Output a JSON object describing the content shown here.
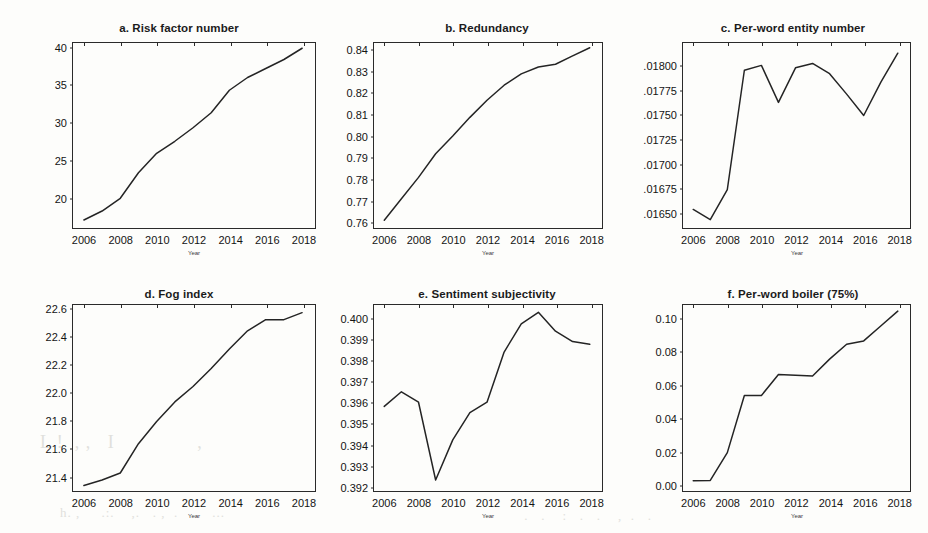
{
  "figure": {
    "background_color": "#fdfdfb",
    "line_color": "#242424",
    "axis_color": "#2a2a2a",
    "xaxis_title": "Year",
    "xtick_labels": [
      "2006",
      "2008",
      "2010",
      "2012",
      "2014",
      "2016",
      "2018"
    ],
    "xtick_values": [
      2006,
      2008,
      2010,
      2012,
      2014,
      2016,
      2018
    ],
    "xlim": [
      2005.4,
      2018.6
    ]
  },
  "chart_data": [
    {
      "type": "line",
      "panel": "a",
      "title": "a. Risk factor number",
      "xlabel": "Year",
      "ylabel": "",
      "x": [
        2006,
        2007,
        2008,
        2009,
        2010,
        2011,
        2012,
        2013,
        2014,
        2015,
        2016,
        2017,
        2018
      ],
      "values": [
        17.0,
        18.2,
        19.9,
        23.3,
        25.9,
        27.5,
        29.3,
        31.3,
        34.3,
        36.0,
        37.2,
        38.4,
        39.9
      ],
      "ytick_labels": [
        "20",
        "25",
        "30",
        "35",
        "40"
      ],
      "ytick_values": [
        20,
        25,
        30,
        35,
        40
      ],
      "ylim": [
        16.2,
        40.6
      ],
      "grid": false,
      "legend": "none"
    },
    {
      "type": "line",
      "panel": "b",
      "title": "b. Redundancy",
      "xlabel": "Year",
      "ylabel": "",
      "x": [
        2006,
        2007,
        2008,
        2009,
        2010,
        2011,
        2012,
        2013,
        2014,
        2015,
        2016,
        2017,
        2018
      ],
      "values": [
        0.7605,
        0.7705,
        0.7805,
        0.7915,
        0.7998,
        0.8085,
        0.8165,
        0.8235,
        0.8288,
        0.832,
        0.8333,
        0.8372,
        0.841
      ],
      "ytick_labels": [
        "0.76",
        "0.77",
        "0.78",
        "0.79",
        "0.80",
        "0.81",
        "0.82",
        "0.83",
        "0.84"
      ],
      "ytick_values": [
        0.76,
        0.77,
        0.78,
        0.79,
        0.8,
        0.81,
        0.82,
        0.83,
        0.84
      ],
      "ylim": [
        0.7578,
        0.8432
      ],
      "grid": false,
      "legend": "none"
    },
    {
      "type": "line",
      "panel": "c",
      "title": "c. Per-word entity number",
      "xlabel": "Year",
      "ylabel": "",
      "x": [
        2006,
        2007,
        2008,
        2009,
        2010,
        2011,
        2012,
        2013,
        2014,
        2015,
        2016,
        2017,
        2018
      ],
      "values": [
        0.016525,
        0.01642,
        0.01673,
        0.017955,
        0.018005,
        0.017625,
        0.01798,
        0.018025,
        0.01792,
        0.01771,
        0.01749,
        0.01783,
        0.01813
      ],
      "ytick_labels": [
        ".01650",
        ".01675",
        ".01700",
        ".01725",
        ".01750",
        ".01775",
        ".01800"
      ],
      "ytick_values": [
        0.0165,
        0.01675,
        0.017,
        0.01725,
        0.0175,
        0.01775,
        0.018
      ],
      "ylim": [
        0.016355,
        0.018235
      ],
      "grid": false,
      "legend": "none"
    },
    {
      "type": "line",
      "panel": "d",
      "title": "d. Fog index",
      "xlabel": "Year",
      "ylabel": "",
      "x": [
        2006,
        2007,
        2008,
        2009,
        2010,
        2011,
        2012,
        2013,
        2014,
        2015,
        2016,
        2017,
        2018
      ],
      "values": [
        21.33,
        21.37,
        21.42,
        21.63,
        21.79,
        21.93,
        22.04,
        22.17,
        22.31,
        22.44,
        22.52,
        22.52,
        22.57
      ],
      "ytick_labels": [
        "21.4",
        "21.6",
        "21.8",
        "22.0",
        "22.2",
        "22.4",
        "22.6"
      ],
      "ytick_values": [
        21.4,
        21.6,
        21.8,
        22.0,
        22.2,
        22.4,
        22.6
      ],
      "ylim": [
        21.305,
        22.625
      ],
      "grid": false,
      "legend": "none"
    },
    {
      "type": "line",
      "panel": "e",
      "title": "e. Sentiment subjectivity",
      "xlabel": "Year",
      "ylabel": "",
      "x": [
        2006,
        2007,
        2008,
        2009,
        2010,
        2011,
        2012,
        2013,
        2014,
        2015,
        2016,
        2017,
        2018
      ],
      "values": [
        0.3958,
        0.3965,
        0.396,
        0.39228,
        0.3942,
        0.3955,
        0.396,
        0.3984,
        0.39975,
        0.4003,
        0.3994,
        0.3989,
        0.39877
      ],
      "ytick_labels": [
        "0.392",
        "0.393",
        "0.394",
        "0.395",
        "0.396",
        "0.397",
        "0.398",
        "0.399",
        "0.400"
      ],
      "ytick_values": [
        0.392,
        0.393,
        0.394,
        0.395,
        0.396,
        0.397,
        0.398,
        0.399,
        0.4
      ],
      "ylim": [
        0.39185,
        0.40065
      ],
      "grid": false,
      "legend": "none"
    },
    {
      "type": "line",
      "panel": "f",
      "title": "f. Per-word boiler (75%)",
      "xlabel": "Year",
      "ylabel": "",
      "x": [
        2006,
        2007,
        2008,
        2009,
        2010,
        2011,
        2012,
        2013,
        2014,
        2015,
        2016,
        2017,
        2018
      ],
      "values": [
        0.002,
        0.0022,
        0.019,
        0.0535,
        0.0535,
        0.0662,
        0.0658,
        0.0653,
        0.0755,
        0.0845,
        0.0865,
        0.0955,
        0.1045
      ],
      "ytick_labels": [
        "0.00",
        "0.02",
        "0.04",
        "0.06",
        "0.08",
        "0.10"
      ],
      "ytick_values": [
        0.0,
        0.02,
        0.04,
        0.06,
        0.08,
        0.1
      ],
      "ylim": [
        -0.003,
        0.1082
      ],
      "grid": false,
      "legend": "none"
    }
  ]
}
